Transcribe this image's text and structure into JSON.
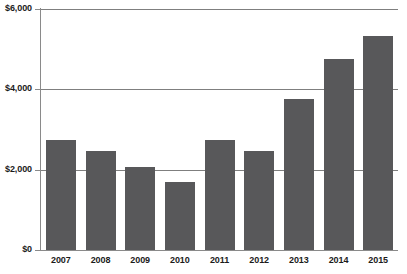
{
  "chart_data": {
    "type": "bar",
    "title": "",
    "title_cropped": true,
    "xlabel": "",
    "ylabel": "",
    "categories": [
      "2007",
      "2008",
      "2009",
      "2010",
      "2011",
      "2012",
      "2013",
      "2014",
      "2015"
    ],
    "values": [
      2750,
      2460,
      2070,
      1690,
      2750,
      2460,
      3760,
      4750,
      5320
    ],
    "ylim": [
      0,
      6000
    ],
    "ytick_values": [
      0,
      2000,
      4000,
      6000
    ],
    "ytick_labels": [
      "$0",
      "$2,000",
      "$4,000",
      "$6,000"
    ],
    "grid": true,
    "grid_axis": "y",
    "legend": false,
    "legend_position": "none",
    "series": [
      {
        "name": "Value",
        "values": [
          2750,
          2460,
          2070,
          1690,
          2750,
          2460,
          3760,
          4750,
          5320
        ]
      }
    ],
    "colors": {
      "bar": "#58585a",
      "gridline": "#7f7f7f",
      "axis": "#8a8a8a",
      "plot_background": "#ffffff",
      "text": "#1b1b1b"
    }
  },
  "axis": {
    "y": {
      "ticks": [
        {
          "label": "$6,000",
          "value": 6000
        },
        {
          "label": "$4,000",
          "value": 4000
        },
        {
          "label": "$2,000",
          "value": 2000
        },
        {
          "label": "$0",
          "value": 0
        }
      ]
    },
    "x": {
      "ticks": [
        {
          "label": "2007"
        },
        {
          "label": "2008"
        },
        {
          "label": "2009"
        },
        {
          "label": "2010"
        },
        {
          "label": "2011"
        },
        {
          "label": "2012"
        },
        {
          "label": "2013"
        },
        {
          "label": "2014"
        },
        {
          "label": "2015"
        }
      ]
    }
  },
  "header": {
    "title_fragment": ""
  }
}
